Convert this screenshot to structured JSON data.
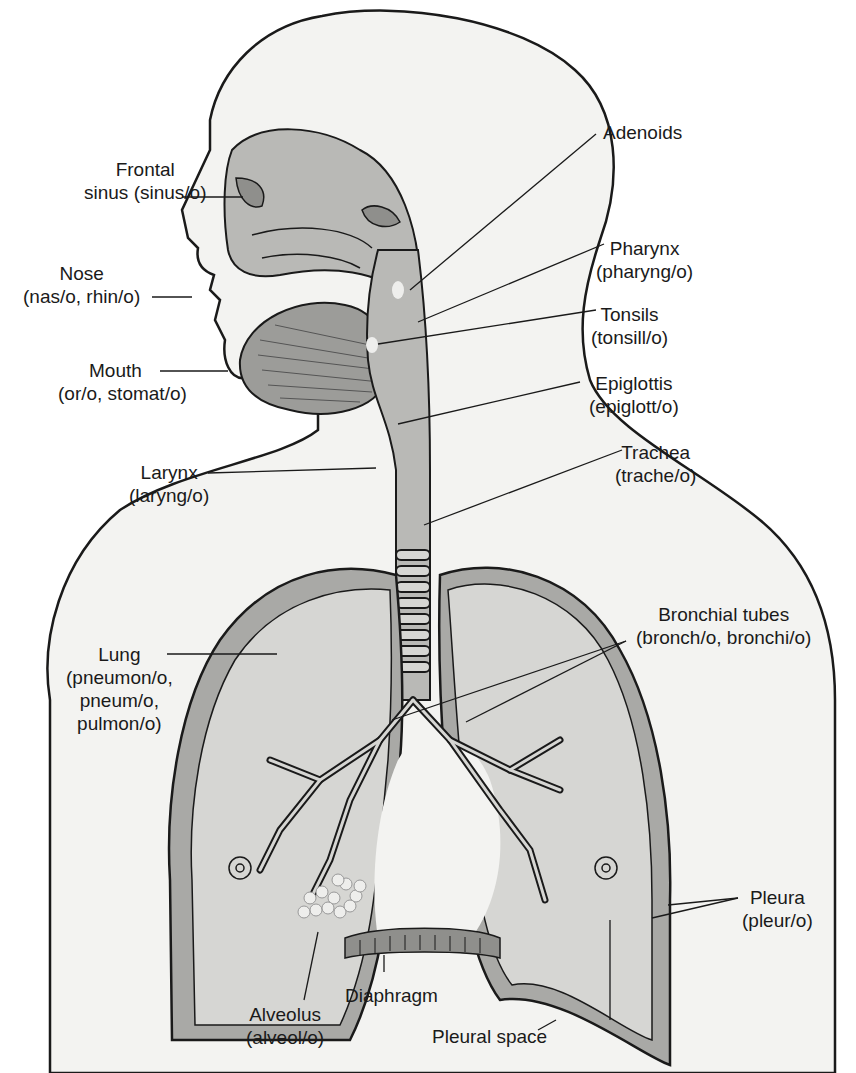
{
  "diagram": {
    "colors": {
      "outline": "#1a1a1a",
      "body_fill": "#f3f3f1",
      "tissue_fill": "#b9b9b6",
      "lung_fill": "#d6d6d3",
      "pleura_fill": "#a9a9a6",
      "airway_fill": "#8f8f8c",
      "background": "#ffffff"
    },
    "labels": {
      "frontal_sinus": {
        "line1": "Frontal",
        "line2": "sinus (sinus/o)"
      },
      "nose": {
        "line1": "Nose",
        "line2": "(nas/o, rhin/o)"
      },
      "mouth": {
        "line1": "Mouth",
        "line2": "(or/o, stomat/o)"
      },
      "larynx": {
        "line1": "Larynx",
        "line2": "(laryng/o)"
      },
      "lung": {
        "line1": "Lung",
        "line2": "(pneumon/o,",
        "line3": "pneum/o,",
        "line4": "pulmon/o)"
      },
      "adenoids": {
        "line1": "Adenoids"
      },
      "pharynx": {
        "line1": "Pharynx",
        "line2": "(pharyng/o)"
      },
      "tonsils": {
        "line1": "Tonsils",
        "line2": "(tonsill/o)"
      },
      "epiglottis": {
        "line1": "Epiglottis",
        "line2": "(epiglott/o)"
      },
      "trachea": {
        "line1": "Trachea",
        "line2": "(trache/o)"
      },
      "bronchial_tubes": {
        "line1": "Bronchial tubes",
        "line2": "(bronch/o, bronchi/o)"
      },
      "pleura": {
        "line1": "Pleura",
        "line2": "(pleur/o)"
      },
      "alveolus": {
        "line1": "Alveolus",
        "line2": "(alveol/o)"
      },
      "diaphragm": {
        "line1": "Diaphragm"
      },
      "pleural_space": {
        "line1": "Pleural space"
      }
    }
  }
}
